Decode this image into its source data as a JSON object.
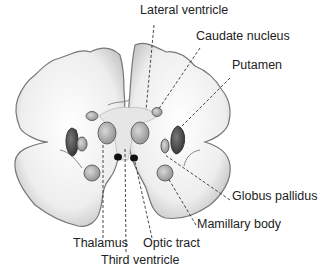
{
  "diagram": {
    "labels": [
      {
        "id": "lateral-ventricle",
        "text": "Lateral ventricle",
        "x": 140,
        "y": 10
      },
      {
        "id": "caudate-nucleus",
        "text": "Caudate nucleus",
        "x": 196,
        "y": 35
      },
      {
        "id": "putamen",
        "text": "Putamen",
        "x": 232,
        "y": 64
      },
      {
        "id": "globus-pallidus",
        "text": "Globus pallidus",
        "x": 232,
        "y": 195
      },
      {
        "id": "mamillary-body",
        "text": "Mamillary body",
        "x": 197,
        "y": 223
      },
      {
        "id": "thalamus",
        "text": "Thalamus",
        "x": 73,
        "y": 242
      },
      {
        "id": "optic-tract",
        "text": "Optic tract",
        "x": 143,
        "y": 242
      },
      {
        "id": "third-ventricle",
        "text": "Third ventricle",
        "x": 101,
        "y": 259
      }
    ],
    "colors": {
      "tissue": "#f4f4f4",
      "outline": "#777777",
      "dark": "#3a3a3a",
      "mid": "#9a9a9a",
      "text": "#222222"
    }
  }
}
